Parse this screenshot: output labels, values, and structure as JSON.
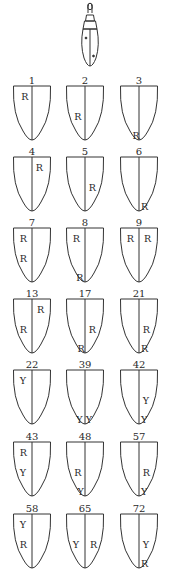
{
  "figure": {
    "type": "elytra-pattern-diagram",
    "icon": "beetle-icon",
    "stroke_color": "#333333",
    "legend_letters": [
      "R",
      "Y"
    ]
  },
  "patterns": [
    {
      "number": "1",
      "marks": [
        {
          "letter": "R",
          "x": 0.22,
          "y": 0.12
        }
      ]
    },
    {
      "number": "2",
      "marks": [
        {
          "letter": "R",
          "x": 0.22,
          "y": 0.48
        }
      ]
    },
    {
      "number": "3",
      "marks": [
        {
          "letter": "R",
          "x": 0.33,
          "y": 0.83
        }
      ]
    },
    {
      "number": "4",
      "marks": [
        {
          "letter": "R",
          "x": 0.6,
          "y": 0.12
        }
      ]
    },
    {
      "number": "5",
      "marks": [
        {
          "letter": "R",
          "x": 0.6,
          "y": 0.48
        }
      ]
    },
    {
      "number": "6",
      "marks": [
        {
          "letter": "R",
          "x": 0.55,
          "y": 0.83
        }
      ]
    },
    {
      "number": "7",
      "marks": [
        {
          "letter": "R",
          "x": 0.18,
          "y": 0.12
        },
        {
          "letter": "R",
          "x": 0.18,
          "y": 0.48
        }
      ]
    },
    {
      "number": "8",
      "marks": [
        {
          "letter": "R",
          "x": 0.18,
          "y": 0.12
        },
        {
          "letter": "R",
          "x": 0.27,
          "y": 0.83
        }
      ]
    },
    {
      "number": "9",
      "marks": [
        {
          "letter": "R",
          "x": 0.18,
          "y": 0.12
        },
        {
          "letter": "R",
          "x": 0.63,
          "y": 0.12
        }
      ]
    },
    {
      "number": "13",
      "marks": [
        {
          "letter": "R",
          "x": 0.63,
          "y": 0.12
        },
        {
          "letter": "R",
          "x": 0.18,
          "y": 0.48
        }
      ]
    },
    {
      "number": "17",
      "marks": [
        {
          "letter": "R",
          "x": 0.6,
          "y": 0.48
        },
        {
          "letter": "R",
          "x": 0.3,
          "y": 0.83
        }
      ]
    },
    {
      "number": "21",
      "marks": [
        {
          "letter": "R",
          "x": 0.6,
          "y": 0.48
        },
        {
          "letter": "R",
          "x": 0.55,
          "y": 0.83
        }
      ]
    },
    {
      "number": "22",
      "marks": [
        {
          "letter": "Y",
          "x": 0.18,
          "y": 0.12
        }
      ]
    },
    {
      "number": "39",
      "marks": [
        {
          "letter": "Y",
          "x": 0.27,
          "y": 0.83
        },
        {
          "letter": "Y",
          "x": 0.52,
          "y": 0.83
        }
      ]
    },
    {
      "number": "42",
      "marks": [
        {
          "letter": "Y",
          "x": 0.6,
          "y": 0.48
        },
        {
          "letter": "Y",
          "x": 0.55,
          "y": 0.83
        }
      ]
    },
    {
      "number": "43",
      "marks": [
        {
          "letter": "R",
          "x": 0.18,
          "y": 0.12
        },
        {
          "letter": "Y",
          "x": 0.18,
          "y": 0.48
        }
      ]
    },
    {
      "number": "48",
      "marks": [
        {
          "letter": "R",
          "x": 0.22,
          "y": 0.48
        },
        {
          "letter": "Y",
          "x": 0.3,
          "y": 0.83
        }
      ]
    },
    {
      "number": "57",
      "marks": [
        {
          "letter": "R",
          "x": 0.6,
          "y": 0.48
        },
        {
          "letter": "Y",
          "x": 0.55,
          "y": 0.83
        }
      ]
    },
    {
      "number": "58",
      "marks": [
        {
          "letter": "Y",
          "x": 0.18,
          "y": 0.12
        },
        {
          "letter": "R",
          "x": 0.18,
          "y": 0.48
        }
      ]
    },
    {
      "number": "65",
      "marks": [
        {
          "letter": "Y",
          "x": 0.18,
          "y": 0.48
        },
        {
          "letter": "R",
          "x": 0.63,
          "y": 0.48
        }
      ]
    },
    {
      "number": "72",
      "marks": [
        {
          "letter": "Y",
          "x": 0.6,
          "y": 0.48
        },
        {
          "letter": "R",
          "x": 0.55,
          "y": 0.83
        }
      ]
    }
  ]
}
